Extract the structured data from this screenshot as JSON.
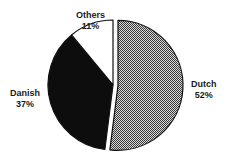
{
  "chart_data": {
    "type": "pie",
    "title": "",
    "categories": [
      "Dutch",
      "Danish",
      "Others"
    ],
    "values": [
      52,
      37,
      11
    ],
    "unit": "%",
    "labels": [
      {
        "name": "Dutch",
        "percent": "52%"
      },
      {
        "name": "Danish",
        "percent": "37%"
      },
      {
        "name": "Others",
        "percent": "11%"
      }
    ],
    "exploded": [
      "Dutch"
    ],
    "start_angle_deg": 0,
    "direction": "clockwise",
    "fills": {
      "Dutch": "checker-pattern-gray",
      "Danish": "#0d0d0d",
      "Others": "#ffffff"
    },
    "legend": "none",
    "data_labels": "outside"
  },
  "colors": {
    "outline": "#111111",
    "checker_dark": "#3a3a3a",
    "checker_light": "#d8d8d8"
  }
}
